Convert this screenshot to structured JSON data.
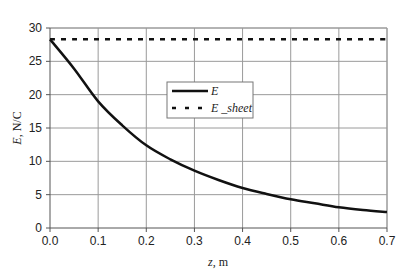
{
  "panel_label": "(a)",
  "chart_data": {
    "type": "line",
    "title": "",
    "xlabel": "z, m",
    "ylabel": "E, N/C",
    "xlabel_var": "z",
    "xlabel_unit": ", m",
    "ylabel_var": "E",
    "ylabel_unit": ", N/C",
    "xlim": [
      0,
      0.7
    ],
    "ylim": [
      0,
      30
    ],
    "x_ticks": [
      "0.0",
      "0.1",
      "0.2",
      "0.3",
      "0.4",
      "0.5",
      "0.6",
      "0.7"
    ],
    "y_ticks": [
      "0",
      "5",
      "10",
      "15",
      "20",
      "25",
      "30"
    ],
    "grid": true,
    "legend_position": "center (inside plot, upper-middle)",
    "x": [
      0,
      0.05,
      0.1,
      0.15,
      0.2,
      0.25,
      0.3,
      0.35,
      0.4,
      0.45,
      0.5,
      0.55,
      0.6,
      0.65,
      0.7
    ],
    "series": [
      {
        "name": "E",
        "style": "solid",
        "color": "#111111",
        "values": [
          28.3,
          23.9,
          19.0,
          15.4,
          12.4,
          10.3,
          8.6,
          7.2,
          6.0,
          5.1,
          4.3,
          3.7,
          3.1,
          2.7,
          2.4
        ]
      },
      {
        "name": "E _sheet",
        "style": "dashed",
        "color": "#111111",
        "values": [
          28.3,
          28.3,
          28.3,
          28.3,
          28.3,
          28.3,
          28.3,
          28.3,
          28.3,
          28.3,
          28.3,
          28.3,
          28.3,
          28.3,
          28.3
        ]
      }
    ]
  },
  "legend": {
    "items": [
      {
        "label": "E",
        "style": "solid"
      },
      {
        "label": "E _sheet",
        "style": "dashed"
      }
    ]
  },
  "colors": {
    "line": "#111111",
    "grid": "#9a9a9a",
    "axis": "#555555",
    "text": "#222222"
  }
}
